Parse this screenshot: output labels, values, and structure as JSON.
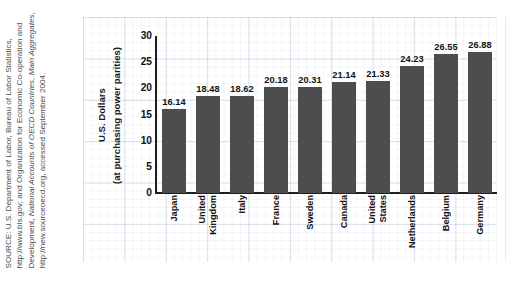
{
  "source_note": {
    "text_prefix": "SOURCE: U.S. Department of Labor, Bureau of Labor Statistics, http://www.bls.gov; and Organization for Economic Co-operation and Development, ",
    "italic_1": "National Accounts of OECD Countries, Main Aggregates,",
    "text_suffix": " http://new.sourceoecd.org, accessed September 2004."
  },
  "chart_data": {
    "type": "bar",
    "title": "",
    "xlabel": "",
    "ylabel": "U.S. Dollars (at purchasing power parities)",
    "ylabel_lines": [
      "U.S. Dollars",
      "(at purchasing power parities)"
    ],
    "ylim": [
      0,
      30
    ],
    "ytick_values": [
      0,
      5,
      10,
      15,
      20,
      25,
      30
    ],
    "ytick_labels": [
      "0",
      "5",
      "10",
      "15",
      "20",
      "25",
      "30"
    ],
    "grid": true,
    "legend": null,
    "bar_color": "#4d4d4d",
    "categories": [
      "Japan",
      "United Kingdom",
      "Italy",
      "France",
      "Sweden",
      "Canada",
      "United States",
      "Netherlands",
      "Belgium",
      "Germany"
    ],
    "values": [
      16.14,
      18.48,
      18.62,
      20.18,
      20.31,
      21.14,
      21.33,
      24.23,
      26.55,
      26.88
    ],
    "value_labels": [
      "16.14",
      "18.48",
      "18.62",
      "20.18",
      "20.31",
      "21.14",
      "21.33",
      "24.23",
      "26.55",
      "26.88"
    ]
  }
}
